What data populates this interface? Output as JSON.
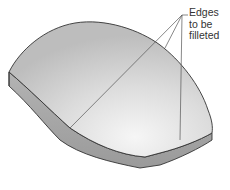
{
  "figure": {
    "callout": {
      "lines": [
        "Edges",
        "to be",
        "filleted"
      ]
    },
    "colors": {
      "top_face_light": "#f4f4f4",
      "top_face_dark": "#c6c6c6",
      "side_face": "#a8a8a8",
      "edge": "#333333",
      "leader": "#555555"
    }
  }
}
